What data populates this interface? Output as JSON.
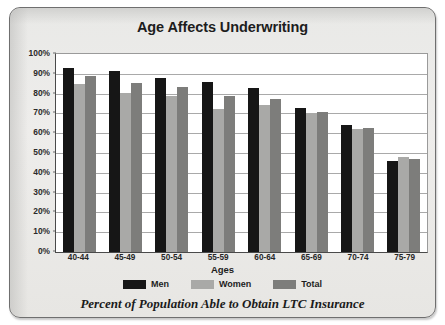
{
  "chart_data": {
    "type": "bar",
    "title": "Age Affects Underwriting",
    "caption": "Percent of Population Able to Obtain LTC Insurance",
    "xlabel": "Ages",
    "ylabel": "",
    "ylim": [
      0,
      100
    ],
    "yticks": [
      "0%",
      "10%",
      "20%",
      "30%",
      "40%",
      "50%",
      "60%",
      "70%",
      "80%",
      "90%",
      "100%"
    ],
    "ytick_values": [
      0,
      10,
      20,
      30,
      40,
      50,
      60,
      70,
      80,
      90,
      100
    ],
    "grid": true,
    "legend_position": "bottom",
    "categories": [
      "40-44",
      "45-49",
      "50-54",
      "55-59",
      "60-64",
      "65-69",
      "70-74",
      "75-79"
    ],
    "series": [
      {
        "name": "Men",
        "color": "#161616",
        "values": [
          93,
          91.5,
          88,
          86,
          83,
          72.5,
          64,
          46
        ]
      },
      {
        "name": "Women",
        "color": "#a9a9a7",
        "values": [
          85,
          80.5,
          79,
          72,
          74,
          70,
          62,
          48
        ]
      },
      {
        "name": "Total",
        "color": "#7d7d7b",
        "values": [
          89,
          85.5,
          83.5,
          79,
          77.5,
          70.5,
          62.5,
          47
        ]
      }
    ]
  }
}
